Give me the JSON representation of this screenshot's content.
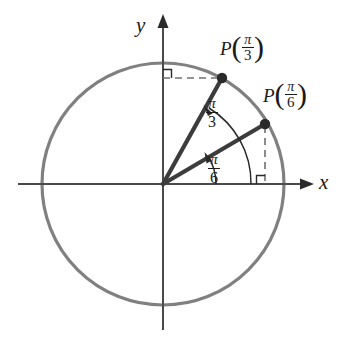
{
  "figure": {
    "background_color": "#ffffff",
    "circle_color": "#808080",
    "axis_color": "#4a4a4a",
    "ray_color": "#3c3c3c",
    "dash_color": "#707070",
    "text_color": "#1a1a1a"
  },
  "axes": {
    "x_label": "x",
    "y_label": "y",
    "origin": {
      "x": 163,
      "y": 184
    }
  },
  "circle": {
    "center_x": 163,
    "center_y": 184,
    "radius": 121
  },
  "points": [
    {
      "id": "p-pi-3",
      "label_p": "P",
      "open_paren": "(",
      "close_paren": ")",
      "numerator": "π",
      "denominator": "3",
      "angle_deg": 60,
      "dot_x": 222,
      "dot_y": 78,
      "label_x": 220,
      "label_y": 33
    },
    {
      "id": "p-pi-6",
      "label_p": "P",
      "open_paren": "(",
      "close_paren": ")",
      "numerator": "π",
      "denominator": "6",
      "angle_deg": 30,
      "dot_x": 265,
      "dot_y": 124,
      "label_x": 263,
      "label_y": 80
    }
  ],
  "angles": [
    {
      "id": "angle-pi-3",
      "numerator": "π",
      "denominator": "3",
      "value_deg": 60,
      "label_x": 206,
      "label_y": 96
    },
    {
      "id": "angle-pi-6",
      "numerator": "π",
      "denominator": "6",
      "value_deg": 30,
      "label_x": 208,
      "label_y": 152
    }
  ],
  "right_angle_markers": [
    {
      "id": "right-angle-top-left",
      "x": 178,
      "y": 78
    },
    {
      "id": "right-angle-bottom-right",
      "x": 265,
      "y": 184
    }
  ]
}
